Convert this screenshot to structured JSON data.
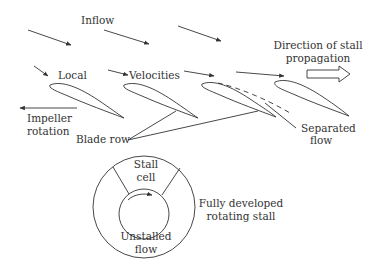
{
  "diagram": {
    "labels": {
      "inflow": "Inflow",
      "local": "Local",
      "velocities": "Velocities",
      "direction_line1": "Direction of stall",
      "direction_line2": "propagation",
      "impeller_line1": "Impeller",
      "impeller_line2": "rotation",
      "blade_row": "Blade row",
      "separated_line1": "Separated",
      "separated_line2": "flow",
      "stall_cell_line1": "Stall",
      "stall_cell_line2": "cell",
      "unstalled_line1": "Unstalled",
      "unstalled_line2": "flow",
      "fully_line1": "Fully developed",
      "fully_line2": "rotating stall"
    },
    "colors": {
      "stroke": "#333333",
      "background": "#ffffff"
    }
  }
}
